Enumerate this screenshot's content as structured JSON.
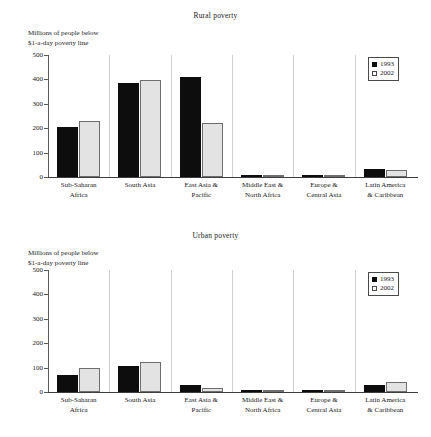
{
  "figure": {
    "axis_caption": "Millions of people below\n$1-a-day poverty line",
    "legend": {
      "series_1_label": "1993",
      "series_2_label": "2002"
    },
    "colors": {
      "series_1": "#0d0d0d",
      "series_2": "#e3e3e3",
      "axis": "#3d3d3d"
    }
  },
  "chart_data": [
    {
      "type": "bar",
      "title": "Rural poverty",
      "xlabel": "",
      "ylabel": "Millions of people below $1-a-day poverty line",
      "ylim": [
        0,
        500
      ],
      "yticks": [
        "0",
        "100",
        "200",
        "300",
        "400",
        "500"
      ],
      "grid": false,
      "legend_position": "top-right",
      "categories": [
        "Sub-Saharan\nAfrica",
        "South Asia",
        "East Asia &\nPacific",
        "Middle East &\nNorth Africa",
        "Europe &\nCentral Asia",
        "Latin America\n& Caribbean"
      ],
      "series": [
        {
          "name": "1993",
          "values": [
            205,
            385,
            408,
            6,
            6,
            31
          ]
        },
        {
          "name": "2002",
          "values": [
            228,
            397,
            223,
            7,
            7,
            29
          ]
        }
      ]
    },
    {
      "type": "bar",
      "title": "Urban poverty",
      "xlabel": "",
      "ylabel": "Millions of people below $1-a-day poverty line",
      "ylim": [
        0,
        500
      ],
      "yticks": [
        "0",
        "100",
        "200",
        "300",
        "400",
        "500"
      ],
      "grid": false,
      "legend_position": "top-right",
      "categories": [
        "Sub-Saharan\nAfrica",
        "South Asia",
        "East Asia &\nPacific",
        "Middle East &\nNorth Africa",
        "Europe &\nCentral Asia",
        "Latin America\n& Caribbean"
      ],
      "series": [
        {
          "name": "1993",
          "values": [
            68,
            107,
            30,
            1,
            6,
            27
          ]
        },
        {
          "name": "2002",
          "values": [
            97,
            125,
            17,
            1,
            4,
            42
          ]
        }
      ]
    }
  ]
}
